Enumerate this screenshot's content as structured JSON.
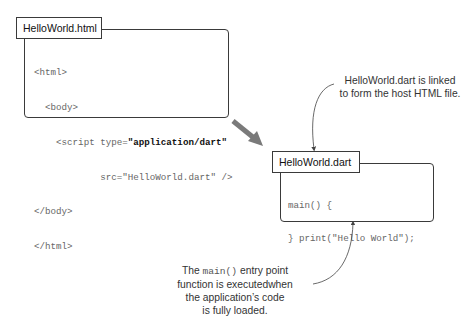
{
  "html_file": {
    "label": "HelloWorld.html",
    "code_lines": [
      {
        "indent": "",
        "pre": "<html>",
        "bold": "",
        "post": ""
      },
      {
        "indent": "  ",
        "pre": "<body>",
        "bold": "",
        "post": ""
      },
      {
        "indent": "    ",
        "pre": "<script type=",
        "bold": "\"application/dart\"",
        "post": ""
      },
      {
        "indent": "            ",
        "pre": "src=\"HelloWorld.dart\" />",
        "bold": "",
        "post": ""
      },
      {
        "indent": "",
        "pre": "</body>",
        "bold": "",
        "post": ""
      },
      {
        "indent": "",
        "pre": "</html>",
        "bold": "",
        "post": ""
      }
    ]
  },
  "dart_file": {
    "label": "HelloWorld.dart",
    "code_lines": [
      "main() {",
      "} print(\"Hello World\");"
    ]
  },
  "callouts": {
    "top": {
      "lines": [
        "HelloWorld.dart is linked",
        "to form the host HTML file."
      ]
    },
    "bottom": {
      "line1_pre": "The ",
      "line1_code": "main()",
      "line1_post": " entry point",
      "line2": "function is executedwhen",
      "line3": "the application’s code",
      "line4": "is fully loaded."
    }
  },
  "colors": {
    "border": "#3a3a3a",
    "big_arrow": "#7a7a7a",
    "thin_arrow": "#444444",
    "code_text": "#666666",
    "code_bold": "#111111"
  }
}
